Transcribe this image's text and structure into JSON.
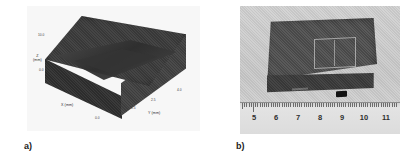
{
  "figure": {
    "panels": [
      {
        "id": "panel-a",
        "caption": "a)",
        "type": "3d-surface-plot",
        "description": "3D surface plot of a rectangular block specimen with a diagonal ridge feature across the top face",
        "axes": {
          "z_label": "Z",
          "z_unit": "(mm)",
          "x_label": "X (mm)",
          "y_label": "Y (mm)",
          "z_ticks": [
            "10.0",
            "0.0"
          ],
          "x_ticks": [
            "0.0"
          ],
          "y_ticks": [
            "1.5",
            "2.5",
            "4.0"
          ]
        }
      },
      {
        "id": "panel-b",
        "caption": "b)",
        "type": "photograph",
        "description": "Photograph of the dark machined block specimen placed on a ruler",
        "ruler": {
          "unit": "cm",
          "labels": [
            "5",
            "6",
            "7",
            "8",
            "9",
            "10",
            "11"
          ]
        }
      }
    ]
  },
  "colors": {
    "page_background": "#ffffff",
    "plot_background": "#f7f7f7",
    "block_top": "#3b3b3b",
    "block_left": "#2f2f2f",
    "block_right": "#414141",
    "photo_background": "#d2d2d2",
    "sample_top": "#4e4e4e",
    "sample_front": "#3b3b3b",
    "ruler_face": "#e3e3e3",
    "text": "#1c1c1c"
  }
}
